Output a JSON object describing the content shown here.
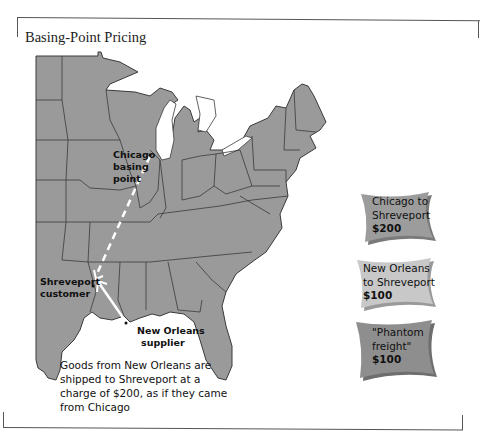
{
  "figure": {
    "title": "Basing-Point Pricing"
  },
  "map": {
    "labels": {
      "chicago_line1": "Chicago",
      "chicago_line2": "basing",
      "chicago_line3": "point",
      "shreveport_line1": "Shreveport",
      "shreveport_line2": "customer",
      "neworleans_line1": "New Orleans",
      "neworleans_line2": "supplier"
    },
    "colors": {
      "land": "#9a9a9a",
      "border": "#3a3a3a",
      "route": "#ffffff"
    }
  },
  "note": {
    "line1": "Goods from New Orleans are",
    "line2": "shipped to Shreveport at a",
    "line3": "charge of $200, as if they came",
    "line4": "from Chicago"
  },
  "cards": [
    {
      "line1": "Chicago to",
      "line2": "Shreveport",
      "amount": "$200",
      "color": "#9c9c9c"
    },
    {
      "line1": "New Orleans",
      "line2": "to Shreveport",
      "amount": "$100",
      "color": "#c8c8c8"
    },
    {
      "line1": "\"Phantom",
      "line2": "freight\"",
      "amount": "$100",
      "color": "#8e8e8e"
    }
  ]
}
